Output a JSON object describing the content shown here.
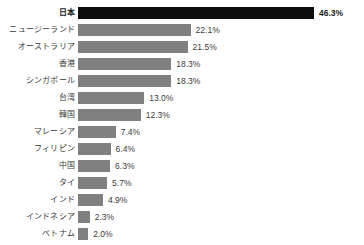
{
  "chart_data": {
    "type": "bar",
    "orientation": "horizontal",
    "title": "",
    "subtitle": "",
    "xlabel": "",
    "ylabel": "",
    "grid": false,
    "legend": false,
    "xlim": [
      0,
      46.3
    ],
    "value_suffix": "%",
    "categories": [
      "日本",
      "ニュージーランド",
      "オーストラリア",
      "香港",
      "シンガポール",
      "台湾",
      "韓国",
      "マレーシア",
      "フィリピン",
      "中国",
      "タイ",
      "インド",
      "インドネシア",
      "ベトナム"
    ],
    "values": [
      46.3,
      22.1,
      21.5,
      18.3,
      18.3,
      13.0,
      12.3,
      7.4,
      6.4,
      6.3,
      5.7,
      4.9,
      2.3,
      2.0
    ],
    "value_labels": [
      "46.3%",
      "22.1%",
      "21.5%",
      "18.3%",
      "18.3%",
      "13.0%",
      "12.3%",
      "7.4%",
      "6.4%",
      "6.3%",
      "5.7%",
      "4.9%",
      "2.3%",
      "2.0%"
    ],
    "highlight_index": 0,
    "colors": {
      "bar": "#808080",
      "bar_highlight": "#0d0d0d",
      "text": "#3a3a3a",
      "text_highlight": "#1a1a1a",
      "background": "#ffffff"
    }
  }
}
